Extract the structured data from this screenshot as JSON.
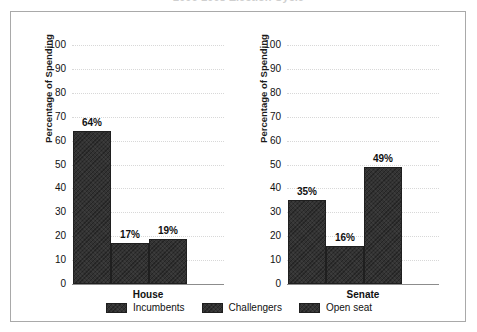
{
  "title": "2006-2008 Election Cycle",
  "frame": {
    "border_color": "#a9a9a9"
  },
  "colors": {
    "bar": "#333333",
    "bar_border": "#1f1f1f",
    "gridline": "#d8d8d8",
    "axis": "#8c8c8c",
    "text": "#111111"
  },
  "legend": {
    "items": [
      {
        "label": "Incumbents"
      },
      {
        "label": "Challengers"
      },
      {
        "label": "Open seat"
      }
    ]
  },
  "chart_data": {
    "type": "bar",
    "title": "2006-2008 Election Cycle",
    "xlabel": "",
    "ylabel": "Percentage of Spending",
    "ylim": [
      0,
      100
    ],
    "yticks": [
      0,
      10,
      20,
      30,
      40,
      50,
      60,
      70,
      80,
      90,
      100
    ],
    "ytick_labels": [
      "0",
      "10",
      "20",
      "30",
      "40",
      "50",
      "60",
      "70",
      "80",
      "90",
      "100"
    ],
    "grid": true,
    "legend_position": "bottom",
    "categories": [
      "Incumbents",
      "Challengers",
      "Open seat"
    ],
    "panels": [
      {
        "name": "House",
        "ylabel": "Percentage of Spending",
        "values": [
          64,
          17,
          19
        ],
        "value_labels": [
          "64%",
          "17%",
          "19%"
        ]
      },
      {
        "name": "Senate",
        "ylabel": "Percentage of Spending",
        "values": [
          35,
          16,
          49
        ],
        "value_labels": [
          "35%",
          "16%",
          "49%"
        ]
      }
    ]
  }
}
